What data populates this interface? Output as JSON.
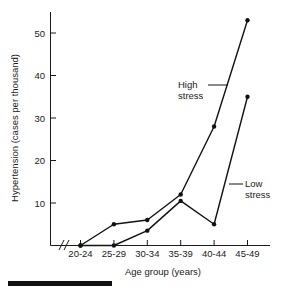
{
  "chart_data": {
    "type": "line",
    "title": "",
    "xlabel": "Age group (years)",
    "ylabel": "Hypertension (cases per thousand)",
    "categories": [
      "20-24",
      "25-29",
      "30-34",
      "35-39",
      "40-44",
      "45-49"
    ],
    "series": [
      {
        "name": "High stress",
        "values": [
          0,
          5,
          6,
          12,
          28,
          53
        ]
      },
      {
        "name": "Low stress",
        "values": [
          0,
          0,
          3.5,
          10.5,
          5,
          35
        ]
      }
    ],
    "ylim": [
      0,
      55
    ],
    "yticks": [
      10,
      20,
      30,
      40,
      50
    ],
    "ytick_labels": [
      "10",
      "20",
      "30",
      "40",
      "50"
    ],
    "grid": false,
    "legend": "inline-annotations",
    "axis_break": "//",
    "annotations": [
      {
        "text_line1": "High",
        "text_line2": "stress",
        "target_series": "High stress"
      },
      {
        "text_line1": "Low",
        "text_line2": "stress",
        "target_series": "Low stress"
      }
    ],
    "marker_style": "filled-circle",
    "line_color": "#111111"
  },
  "axis": {
    "y_tick_0": "10",
    "y_tick_1": "20",
    "y_tick_2": "30",
    "y_tick_3": "40",
    "y_tick_4": "50",
    "x_tick_0": "20-24",
    "x_tick_1": "25-29",
    "x_tick_2": "30-34",
    "x_tick_3": "35-39",
    "x_tick_4": "40-44",
    "x_tick_5": "45-49",
    "x_title": "Age group (years)",
    "y_title": "Hypertension (cases per thousand)"
  },
  "annotations": {
    "high_line1": "High",
    "high_line2": "stress",
    "low_line1": "Low",
    "low_line2": "stress"
  }
}
